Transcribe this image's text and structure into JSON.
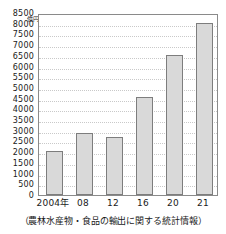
{
  "chart_data": {
    "type": "bar",
    "title": "",
    "subtitle": "",
    "xlabel": "",
    "ylabel": "億円",
    "categories": [
      "2004年",
      "08",
      "12",
      "16",
      "20",
      "21"
    ],
    "values": [
      2050,
      2900,
      2700,
      4600,
      6550,
      8050
    ],
    "series": [
      {
        "name": "農林水産物・食品の輸出額",
        "values": [
          2050,
          2900,
          2700,
          4600,
          6550,
          8050
        ]
      }
    ],
    "ylim": [
      0,
      8500
    ],
    "y_tick_step": 500,
    "y_ticks": [
      "8500",
      "8000",
      "7500",
      "7000",
      "6500",
      "6000",
      "5500",
      "5000",
      "4500",
      "4000",
      "3500",
      "3000",
      "2500",
      "2000",
      "1500",
      "1000",
      "500",
      "0"
    ],
    "y_tick_values": [
      8500,
      8000,
      7500,
      7000,
      6500,
      6000,
      5500,
      5000,
      4500,
      4000,
      3500,
      3000,
      2500,
      2000,
      1500,
      1000,
      500,
      0
    ],
    "grid": true,
    "grid_orientation": "horizontal",
    "legend": false,
    "legend_position": "none",
    "bar_fill_color": "#d9d9d9",
    "bar_border_color": "#7d7d7d",
    "grid_color": "#c9c9c9",
    "axis_color": "#8a8a8a",
    "caption": "（農林水産物・食品の輸出に関する統計情報）"
  }
}
